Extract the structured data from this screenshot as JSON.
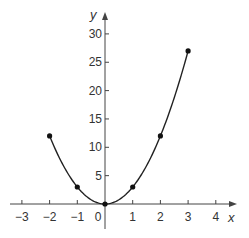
{
  "chart_data": {
    "type": "line",
    "title": "",
    "xlabel": "x",
    "ylabel": "y",
    "x": [
      -2,
      -1,
      0,
      1,
      2,
      3
    ],
    "series": [
      {
        "name": "y = 3x^2",
        "values": [
          12,
          3,
          0,
          3,
          12,
          27
        ],
        "markers": true,
        "smooth": true
      }
    ],
    "x_ticks": [
      -3,
      -2,
      -1,
      0,
      1,
      2,
      3,
      4
    ],
    "x_tick_labels": [
      "−3",
      "−2",
      "−1",
      "0",
      "1",
      "2",
      "3",
      "4"
    ],
    "y_ticks": [
      5,
      10,
      15,
      20,
      25,
      30
    ],
    "y_tick_labels": [
      "5",
      "10",
      "15",
      "20",
      "25",
      "30"
    ],
    "xlim": [
      -3.4,
      4.4
    ],
    "ylim": [
      -5,
      33
    ],
    "grid": false,
    "legend": "none",
    "colors": {
      "line": "#222222",
      "axis": "#444444",
      "text": "#333333"
    }
  }
}
